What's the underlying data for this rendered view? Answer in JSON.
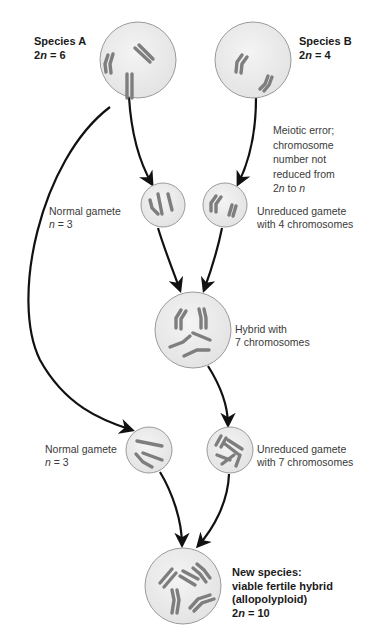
{
  "diagram": {
    "colors": {
      "cell_fill": "#ececec",
      "cell_stroke": "#9a9a9a",
      "chromosome": "#808080",
      "arrow": "#111111"
    },
    "nodes": {
      "species_a": {
        "name": "Species A",
        "ploidy_prefix": "2",
        "ploidy_var": "n",
        "ploidy_suffix": " = 6"
      },
      "species_b": {
        "name": "Species B",
        "ploidy_prefix": "2",
        "ploidy_var": "n",
        "ploidy_suffix": " = 4"
      },
      "meiotic_note": {
        "lines": [
          "Meiotic error;",
          "chromosome",
          "number not",
          "reduced from"
        ],
        "last_a": "2",
        "last_b": "n",
        "last_c": " to ",
        "last_d": "n"
      },
      "normal_gamete_1": {
        "line1": "Normal gamete",
        "var": "n",
        "suffix": " = 3"
      },
      "unreduced_gamete_1": {
        "line1": "Unreduced gamete",
        "line2": "with 4 chromosomes"
      },
      "hybrid": {
        "line1": "Hybrid with",
        "line2": "7 chromosomes"
      },
      "normal_gamete_2": {
        "line1": "Normal gamete",
        "var": "n",
        "suffix": " = 3"
      },
      "unreduced_gamete_2": {
        "line1": "Unreduced gamete",
        "line2": "with 7 chromosomes"
      },
      "new_species": {
        "line1": "New species:",
        "line2": "viable fertile hybrid",
        "line3": "(allopolyploid)",
        "ploidy_prefix": "2",
        "ploidy_var": "n",
        "ploidy_suffix": " = 10"
      }
    }
  }
}
